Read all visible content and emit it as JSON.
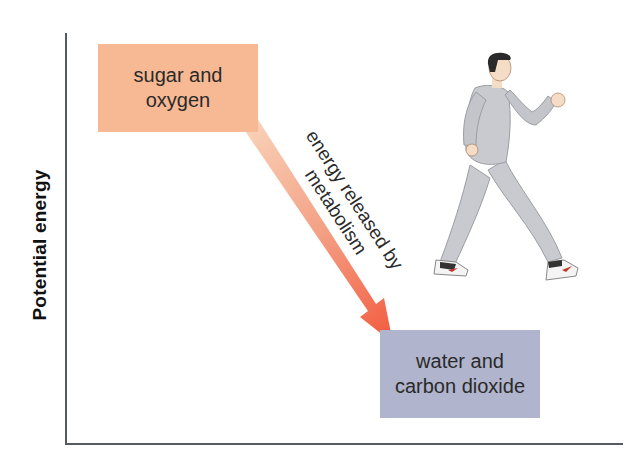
{
  "diagram": {
    "y_axis_label": "Potential energy",
    "x_axis_label": "",
    "start_box": {
      "line1": "sugar and",
      "line2": "oxygen",
      "color": "#f7b993"
    },
    "end_box": {
      "line1": "water and",
      "line2": "carbon dioxide",
      "color": "#b0b4cc"
    },
    "arrow": {
      "line1": "energy released by",
      "line2": "metabolism",
      "color_start": "#f6c7a8",
      "color_end": "#f26045"
    },
    "illustration": "walking-person"
  }
}
